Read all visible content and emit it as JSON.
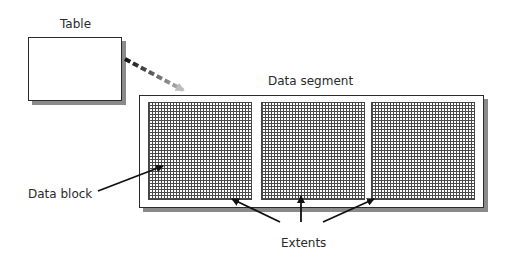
{
  "diagram": {
    "table": {
      "label": "Table"
    },
    "segment": {
      "label": "Data segment"
    },
    "extents": [
      {
        "name": "extent-1"
      },
      {
        "name": "extent-2"
      },
      {
        "name": "extent-3"
      }
    ],
    "annotations": {
      "data_block": "Data block",
      "extents": "Extents"
    },
    "colors": {
      "outline": "#2b2b2b",
      "shadow": "#8a8a8a",
      "grid_line": "#4a4a4a",
      "arrow": "#111111",
      "dashed_arrow_start": "#111111",
      "dashed_arrow_end": "#bdbdbd"
    }
  }
}
